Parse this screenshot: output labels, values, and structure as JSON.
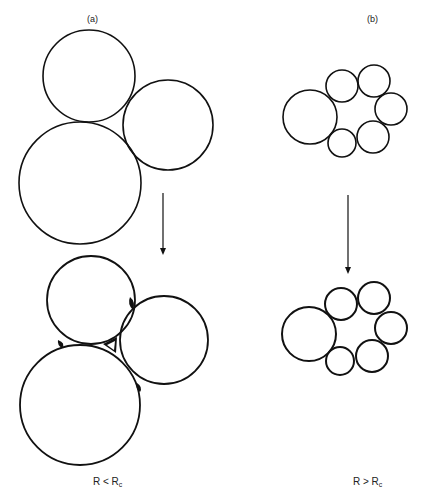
{
  "panels": {
    "a": {
      "label": "(a)",
      "condition_main": "R < R",
      "condition_sub": "c",
      "before": [
        {
          "cx": 89,
          "cy": 76,
          "r": 46
        },
        {
          "cx": 168,
          "cy": 125,
          "r": 45
        },
        {
          "cx": 80,
          "cy": 183,
          "r": 61
        }
      ],
      "after": [
        {
          "cx": 91,
          "cy": 300,
          "r": 44
        },
        {
          "cx": 164,
          "cy": 340,
          "r": 44
        },
        {
          "cx": 80,
          "cy": 405,
          "r": 60
        }
      ],
      "arrow": {
        "x": 163,
        "y1": 193,
        "y2": 255
      }
    },
    "b": {
      "label": "(b)",
      "condition_main": "R > R",
      "condition_sub": "c",
      "before": [
        {
          "cx": 310,
          "cy": 117,
          "r": 27
        },
        {
          "cx": 342,
          "cy": 86,
          "r": 16
        },
        {
          "cx": 374,
          "cy": 81,
          "r": 16
        },
        {
          "cx": 391,
          "cy": 109,
          "r": 16
        },
        {
          "cx": 373,
          "cy": 137,
          "r": 16
        },
        {
          "cx": 342,
          "cy": 143,
          "r": 14
        }
      ],
      "after": [
        {
          "cx": 309,
          "cy": 334,
          "r": 27
        },
        {
          "cx": 341,
          "cy": 304,
          "r": 16
        },
        {
          "cx": 374,
          "cy": 298,
          "r": 16
        },
        {
          "cx": 391,
          "cy": 328,
          "r": 16
        },
        {
          "cx": 372,
          "cy": 356,
          "r": 16
        },
        {
          "cx": 340,
          "cy": 361,
          "r": 14
        }
      ],
      "arrow": {
        "x": 348,
        "y1": 195,
        "y2": 274
      }
    }
  },
  "colors": {
    "stroke": "#111111",
    "background": "#ffffff"
  }
}
